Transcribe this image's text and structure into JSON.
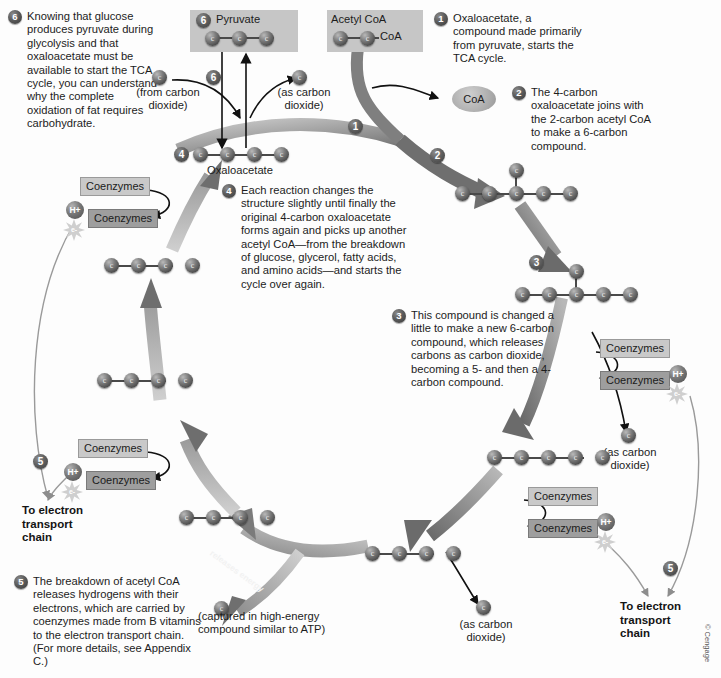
{
  "figure": {
    "copyright": "© Cengage"
  },
  "colors": {
    "carbon_sphere": "#4c4c4c",
    "shade_box": "#c6c6c6",
    "coenzyme_box_light": "#c9c9c9",
    "coenzyme_box_dark": "#9e9e9e",
    "ribbon_arrow": "#7a7a7a",
    "badge": "#5b5b5b",
    "text": "#1c1c1c"
  },
  "steps": [
    {
      "number": "6",
      "text": "Knowing that glucose produces pyruvate during glycolysis and that oxaloacetate must be available to start the TCA cycle, you can understand why the complete oxidation of fat requires carbohydrate."
    },
    {
      "number": "1",
      "text": "Oxaloacetate, a compound made primarily from pyruvate, starts the TCA cycle."
    },
    {
      "number": "2",
      "text": "The 4-carbon oxaloacetate joins with the 2-carbon acetyl CoA to make a 6-carbon compound."
    },
    {
      "number": "4",
      "text": "Each reaction changes the structure slightly until finally the original 4-carbon oxaloacetate forms again and picks up another acetyl CoA—from the breakdown of glucose, glycerol, fatty acids, and amino acids—and starts the cycle over again."
    },
    {
      "number": "3",
      "text": "This compound is changed a little to make a new 6-carbon compound, which releases carbons as carbon dioxide, becoming a 5- and then a 4-carbon compound."
    },
    {
      "number": "5",
      "text": "The breakdown of acetyl CoA releases hydrogens with their electrons, which are carried by coenzymes made from B vitamins to the electron transport chain. (For more details, see Appendix C.)"
    }
  ],
  "molecules": {
    "pyruvate": {
      "label": "Pyruvate",
      "badge": "6",
      "carbons": 3
    },
    "acetyl_coa": {
      "label": "Acetyl CoA",
      "carbons": 2,
      "tail_label": "CoA"
    },
    "oxaloacetate": {
      "label": "Oxaloacetate",
      "badge": "4",
      "carbons": 4
    },
    "coa_free": {
      "label": "CoA"
    },
    "six_carbon_top": {
      "carbons": 6
    },
    "six_carbon_mid": {
      "carbons": 6
    },
    "five_carbon_right": {
      "carbons": 5
    },
    "four_carbon_bottom": {
      "carbons": 4
    },
    "four_carbon_lower_left": {
      "carbons": 4
    },
    "four_carbon_mid_left": {
      "carbons": 4
    },
    "four_carbon_upper_left": {
      "carbons": 4
    }
  },
  "labels": {
    "from_carbon_dioxide": "(from carbon\ndioxide)",
    "as_carbon_dioxide": "(as carbon\ndioxide)",
    "to_electron_transport_chain": "To electron\ntransport\nchain",
    "captured_atp": "(captured in high-energy\ncompound similar to ATP)",
    "releases_energy": "releases energy",
    "coenzymes": "Coenzymes",
    "h_plus": "H+",
    "electron": "e-"
  },
  "inline_badges": {
    "step6_center": "6",
    "step1_ribbon": "1",
    "step2_ribbon": "2",
    "step3_ribbon": "3",
    "step5_left": "5",
    "step5_right": "5"
  }
}
